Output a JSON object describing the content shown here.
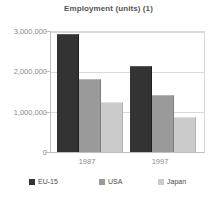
{
  "chart_data": {
    "type": "bar",
    "title": "Employment (units) (1)",
    "xlabel": "",
    "ylabel": "",
    "categories": [
      "1987",
      "1997"
    ],
    "series": [
      {
        "name": "EU-15",
        "color": "#333333",
        "values": [
          2950000,
          2150000
        ]
      },
      {
        "name": "USA",
        "color": "#9a9a9a",
        "values": [
          1820000,
          1420000
        ]
      },
      {
        "name": "Japan",
        "color": "#cbcbcb",
        "values": [
          1250000,
          870000
        ]
      }
    ],
    "ylim": [
      0,
      3000000
    ],
    "ytick_labels": [
      "3,000,000",
      "2,000,000",
      "1,000,000",
      "0"
    ],
    "ytick_values": [
      3000000,
      2000000,
      1000000,
      0
    ],
    "grid": true,
    "legend_position": "bottom"
  },
  "legend": {
    "items": [
      {
        "label": "EU-15",
        "color": "#333333"
      },
      {
        "label": "USA",
        "color": "#9a9a9a"
      },
      {
        "label": "Japan",
        "color": "#cbcbcb"
      }
    ]
  }
}
